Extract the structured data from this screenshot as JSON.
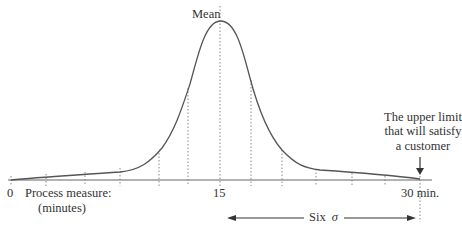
{
  "diagram": {
    "type": "normal-distribution",
    "mean_label": "Mean",
    "axis": {
      "start_label": "0",
      "mid_label": "15",
      "end_label": "30 min.",
      "title_line1": "Process measure:",
      "title_line2": "(minutes)"
    },
    "annotation": {
      "line1": "The upper limit",
      "line2": "that will satisfy",
      "line3": "a customer"
    },
    "span": {
      "label_text": "Six",
      "label_symbol": "σ"
    },
    "colors": {
      "curve": "#555555",
      "axis": "#666666",
      "dotted": "#888888",
      "text": "#333333"
    }
  }
}
